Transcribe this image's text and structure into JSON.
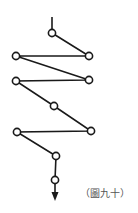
{
  "figure": {
    "caption": "（圖九十）",
    "stroke_color": "#1a1a1a",
    "node_fill": "#ffffff",
    "nodes": [
      {
        "x": 52,
        "y": 33
      },
      {
        "x": 89,
        "y": 56
      },
      {
        "x": 16,
        "y": 56
      },
      {
        "x": 89,
        "y": 80
      },
      {
        "x": 16,
        "y": 81
      },
      {
        "x": 54,
        "y": 106
      },
      {
        "x": 91,
        "y": 131
      },
      {
        "x": 17,
        "y": 132
      },
      {
        "x": 56,
        "y": 156
      },
      {
        "x": 55,
        "y": 180
      }
    ],
    "entry_line": {
      "x": 52,
      "y1": 17,
      "y2": 29
    },
    "exit_arrow": {
      "x": 55,
      "y1": 184,
      "tip_y": 200
    }
  }
}
